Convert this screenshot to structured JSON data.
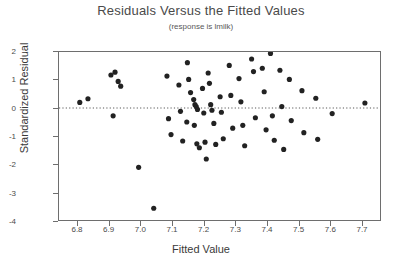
{
  "chart_data": {
    "type": "scatter",
    "title": "Residuals Versus the Fitted Values",
    "subtitle": "(response is lmilk)",
    "xlabel": "Fitted Value",
    "ylabel": "Standardized Residual",
    "xlim": [
      6.74,
      7.76
    ],
    "ylim": [
      -4,
      2
    ],
    "xticks": [
      6.8,
      6.9,
      7.0,
      7.1,
      7.2,
      7.3,
      7.4,
      7.5,
      7.6,
      7.7
    ],
    "xtick_labels": [
      "6.8",
      "6.9",
      "7.0",
      "7.1",
      "7.2",
      "7.3",
      "7.4",
      "7.5",
      "7.6",
      "7.7"
    ],
    "yticks": [
      2,
      1,
      0,
      -1,
      -2,
      -3,
      -4
    ],
    "ytick_labels": [
      "2",
      "1",
      "0",
      "-1",
      "-2",
      "-3",
      "-4"
    ],
    "grid": false,
    "legend": "none",
    "reference_line": {
      "y": 0,
      "style": "dotted",
      "color": "#555555"
    },
    "marker": {
      "shape": "circle",
      "color": "#222222",
      "size": 2.6
    },
    "points": [
      [
        6.806,
        0.2
      ],
      [
        6.832,
        0.33
      ],
      [
        6.905,
        1.18
      ],
      [
        6.918,
        1.28
      ],
      [
        6.928,
        0.95
      ],
      [
        6.936,
        0.78
      ],
      [
        6.912,
        -0.28
      ],
      [
        6.993,
        -2.12
      ],
      [
        7.041,
        -3.58
      ],
      [
        7.083,
        1.14
      ],
      [
        7.088,
        -0.38
      ],
      [
        7.096,
        -0.95
      ],
      [
        7.121,
        0.82
      ],
      [
        7.126,
        -0.12
      ],
      [
        7.133,
        -1.18
      ],
      [
        7.148,
        1.62
      ],
      [
        7.152,
        1.02
      ],
      [
        7.158,
        0.55
      ],
      [
        7.146,
        -0.5
      ],
      [
        7.168,
        0.3
      ],
      [
        7.172,
        0.12
      ],
      [
        7.176,
        0.05
      ],
      [
        7.18,
        -0.05
      ],
      [
        7.17,
        -0.62
      ],
      [
        7.178,
        -1.28
      ],
      [
        7.186,
        -1.42
      ],
      [
        7.196,
        0.7
      ],
      [
        7.2,
        -0.18
      ],
      [
        7.204,
        -1.22
      ],
      [
        7.208,
        -1.82
      ],
      [
        7.214,
        1.25
      ],
      [
        7.218,
        0.88
      ],
      [
        7.222,
        0.12
      ],
      [
        7.226,
        -0.08
      ],
      [
        7.232,
        -0.55
      ],
      [
        7.238,
        -1.3
      ],
      [
        7.252,
        0.4
      ],
      [
        7.256,
        -0.15
      ],
      [
        7.262,
        -1.1
      ],
      [
        7.281,
        1.52
      ],
      [
        7.286,
        0.45
      ],
      [
        7.292,
        -0.72
      ],
      [
        7.312,
        1.05
      ],
      [
        7.318,
        0.22
      ],
      [
        7.324,
        -0.62
      ],
      [
        7.33,
        -1.35
      ],
      [
        7.352,
        1.75
      ],
      [
        7.358,
        1.3
      ],
      [
        7.364,
        -0.35
      ],
      [
        7.386,
        1.42
      ],
      [
        7.392,
        0.58
      ],
      [
        7.398,
        -0.78
      ],
      [
        7.412,
        1.95
      ],
      [
        7.418,
        -0.28
      ],
      [
        7.424,
        -1.15
      ],
      [
        7.442,
        1.35
      ],
      [
        7.448,
        0.05
      ],
      [
        7.454,
        -1.48
      ],
      [
        7.472,
        1.02
      ],
      [
        7.478,
        -0.45
      ],
      [
        7.512,
        0.62
      ],
      [
        7.518,
        -0.88
      ],
      [
        7.556,
        0.35
      ],
      [
        7.562,
        -1.12
      ],
      [
        7.608,
        -0.2
      ],
      [
        7.712,
        0.18
      ]
    ]
  }
}
